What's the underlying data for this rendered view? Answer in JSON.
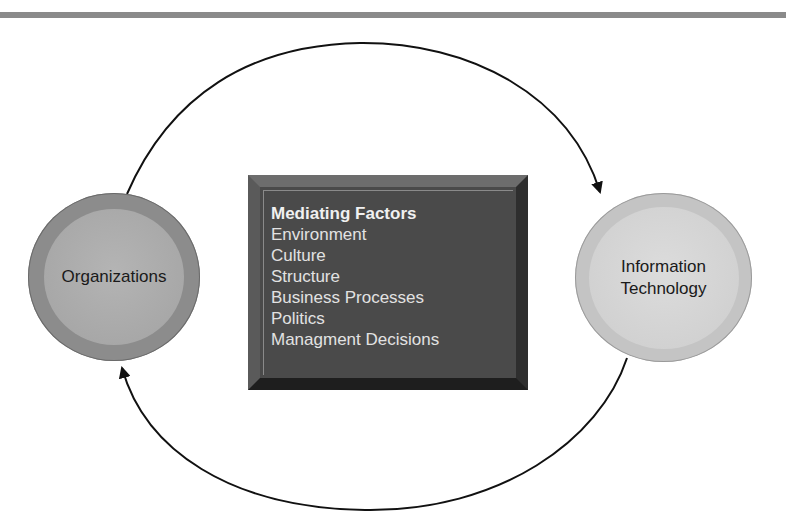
{
  "diagram": {
    "nodes": {
      "organizations": {
        "label": "Organizations"
      },
      "information_technology": {
        "line1": "Information",
        "line2": "Technology"
      }
    },
    "mediating_factors": {
      "title": "Mediating Factors",
      "items": [
        "Environment",
        "Culture",
        "Structure",
        "Business Processes",
        "Politics",
        "Managment Decisions"
      ]
    },
    "edges": [
      {
        "from": "Organizations",
        "to": "Information Technology",
        "path": "top arc"
      },
      {
        "from": "Information Technology",
        "to": "Organizations",
        "path": "bottom arc"
      }
    ],
    "colors": {
      "org_outer": "#8c8c8c",
      "org_inner": "#a8a8a8",
      "it_outer": "#c4c4c4",
      "it_inner": "#d4d4d4",
      "box": "#4a4a4a",
      "rule": "#8a8a8a"
    }
  }
}
